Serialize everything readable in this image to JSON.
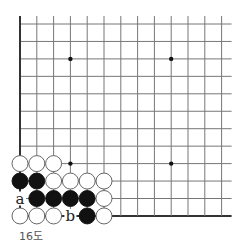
{
  "diagram": {
    "caption": "16도",
    "board": {
      "columns": 13,
      "rows": 12,
      "origin_x": 20,
      "origin_y": 24,
      "spacing_x": 16.8,
      "spacing_y": 17.45,
      "left_edge": true,
      "bottom_edge": true,
      "line_color": "#777777",
      "edge_color": "#333333"
    },
    "hoshi": [
      {
        "col": 3,
        "row": 2
      },
      {
        "col": 9,
        "row": 2
      },
      {
        "col": 3,
        "row": 8
      },
      {
        "col": 9,
        "row": 8
      }
    ],
    "stones": [
      {
        "color": "white",
        "col": 0,
        "row": 8
      },
      {
        "color": "white",
        "col": 1,
        "row": 8
      },
      {
        "color": "white",
        "col": 2,
        "row": 8
      },
      {
        "color": "black",
        "col": 0,
        "row": 9
      },
      {
        "color": "black",
        "col": 1,
        "row": 9
      },
      {
        "color": "white",
        "col": 2,
        "row": 9
      },
      {
        "color": "white",
        "col": 3,
        "row": 9
      },
      {
        "color": "white",
        "col": 4,
        "row": 9
      },
      {
        "color": "white",
        "col": 5,
        "row": 9
      },
      {
        "color": "black",
        "col": 1,
        "row": 10
      },
      {
        "color": "black",
        "col": 2,
        "row": 10
      },
      {
        "color": "black",
        "col": 3,
        "row": 10
      },
      {
        "color": "black",
        "col": 4,
        "row": 10
      },
      {
        "color": "white",
        "col": 5,
        "row": 10
      },
      {
        "color": "white",
        "col": 0,
        "row": 11
      },
      {
        "color": "white",
        "col": 1,
        "row": 11
      },
      {
        "color": "white",
        "col": 2,
        "row": 11
      },
      {
        "color": "black",
        "col": 4,
        "row": 11
      },
      {
        "color": "white",
        "col": 5,
        "row": 11
      }
    ],
    "labels": [
      {
        "text": "a",
        "col": 0,
        "row": 10
      },
      {
        "text": "b",
        "col": 3,
        "row": 11
      }
    ],
    "colors": {
      "black_stone": "#111111",
      "white_stone": "#ffffff",
      "stone_outline": "#555555",
      "label": "#222222"
    }
  }
}
